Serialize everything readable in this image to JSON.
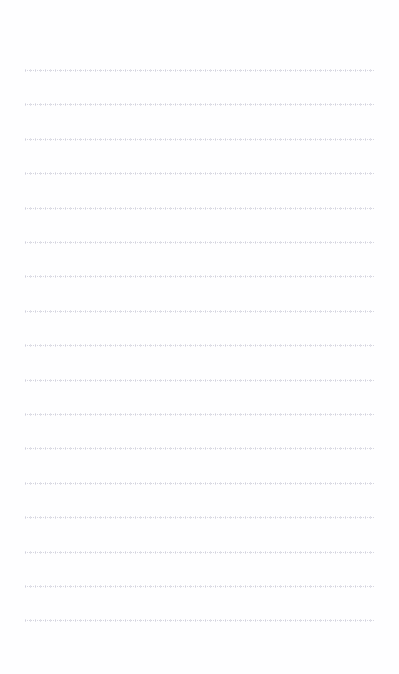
{
  "document": {
    "kind": "lined-paper",
    "title": "",
    "header_text": "",
    "footer_text": "",
    "body_text": "",
    "page_background": "#ffffff"
  },
  "ruling": {
    "line_color": "#d4d4de",
    "line_count": 17,
    "first_line_y": 70,
    "line_spacing": 34.4,
    "left_margin": 25,
    "right_margin": 24,
    "line_style": "dotted",
    "line_thickness": 1
  },
  "lines": [
    {
      "index": 1,
      "y": 70,
      "text": ""
    },
    {
      "index": 2,
      "y": 104,
      "text": ""
    },
    {
      "index": 3,
      "y": 139,
      "text": ""
    },
    {
      "index": 4,
      "y": 173,
      "text": ""
    },
    {
      "index": 5,
      "y": 208,
      "text": ""
    },
    {
      "index": 6,
      "y": 242,
      "text": ""
    },
    {
      "index": 7,
      "y": 276,
      "text": ""
    },
    {
      "index": 8,
      "y": 311,
      "text": ""
    },
    {
      "index": 9,
      "y": 345,
      "text": ""
    },
    {
      "index": 10,
      "y": 380,
      "text": ""
    },
    {
      "index": 11,
      "y": 414,
      "text": ""
    },
    {
      "index": 12,
      "y": 448,
      "text": ""
    },
    {
      "index": 13,
      "y": 483,
      "text": ""
    },
    {
      "index": 14,
      "y": 517,
      "text": ""
    },
    {
      "index": 15,
      "y": 552,
      "text": ""
    },
    {
      "index": 16,
      "y": 586,
      "text": ""
    },
    {
      "index": 17,
      "y": 620,
      "text": ""
    }
  ]
}
